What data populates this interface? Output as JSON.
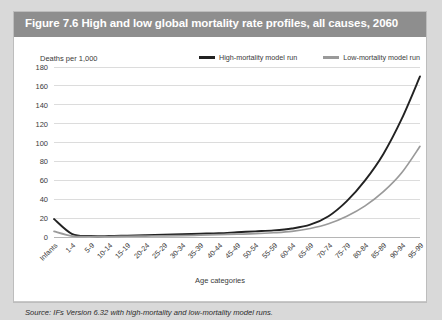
{
  "figure": {
    "title": "Figure 7.6 High and low global mortality rate profiles, all causes, 2060",
    "source": "Source: IFs Version 6.32 with high-mortality and low-mortality model runs."
  },
  "chart_data": {
    "type": "line",
    "title": "Figure 7.6 High and low global mortality rate profiles, all causes, 2060",
    "xlabel": "Age categories",
    "ylabel": "Deaths per 1,000",
    "ylim": [
      0,
      180
    ],
    "yticks": [
      0,
      20,
      40,
      60,
      80,
      100,
      120,
      140,
      160,
      180
    ],
    "grid": true,
    "legend_position": "top-right",
    "categories": [
      "Infants",
      "1-4",
      "5-9",
      "10-14",
      "15-19",
      "20-24",
      "25-29",
      "30-34",
      "35-39",
      "40-44",
      "45-49",
      "50-54",
      "55-59",
      "60-64",
      "65-69",
      "70-74",
      "75-79",
      "80-84",
      "85-89",
      "90-94",
      "95-99"
    ],
    "series": [
      {
        "name": "High-mortality model run",
        "color": "#222222",
        "values": [
          19,
          3,
          1,
          1,
          1.5,
          2,
          2.5,
          3,
          3.5,
          4,
          5,
          6,
          7,
          9,
          13,
          22,
          38,
          60,
          88,
          125,
          170
        ]
      },
      {
        "name": "Low-mortality model run",
        "color": "#9a9a9a",
        "values": [
          6,
          1,
          0.5,
          0.5,
          0.8,
          1,
          1.2,
          1.5,
          2,
          2.5,
          3,
          3.5,
          4.5,
          6,
          9,
          14,
          22,
          33,
          48,
          68,
          96
        ]
      }
    ]
  },
  "legend": [
    {
      "label": "High-mortality model run",
      "color": "#222222"
    },
    {
      "label": "Low-mortality model run",
      "color": "#9a9a9a"
    }
  ]
}
